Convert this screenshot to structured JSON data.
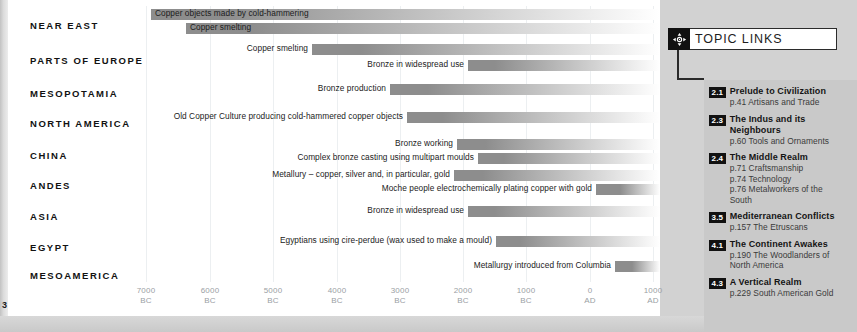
{
  "page": {
    "number": "3"
  },
  "chart_data": {
    "type": "bar",
    "title": "",
    "xlabel": "",
    "ylabel": "",
    "orientation": "horizontal",
    "axis": {
      "grid": true,
      "xlim_labels": [
        "7000 BC",
        "1000 AD"
      ],
      "ticks": [
        {
          "value": "7000",
          "era": "BC",
          "x": 138
        },
        {
          "value": "6000",
          "era": "BC",
          "x": 202
        },
        {
          "value": "5000",
          "era": "BC",
          "x": 265
        },
        {
          "value": "4000",
          "era": "BC",
          "x": 329
        },
        {
          "value": "3000",
          "era": "BC",
          "x": 392
        },
        {
          "value": "2000",
          "era": "BC",
          "x": 455
        },
        {
          "value": "1000",
          "era": "BC",
          "x": 518
        },
        {
          "value": "0",
          "era": "AD",
          "x": 582
        },
        {
          "value": "1000",
          "era": "AD",
          "x": 645
        }
      ]
    },
    "categories": [
      "NEAR EAST",
      "PARTS OF EUROPE",
      "MESOPOTAMIA",
      "NORTH AMERICA",
      "CHINA",
      "ANDES",
      "ASIA",
      "EGYPT",
      "MESOAMERICA"
    ],
    "rows": [
      {
        "label": "NEAR EAST",
        "label_top": 20,
        "bars": [
          {
            "text": "Copper objects made by cold-hammering",
            "start_x": 143,
            "width": 509,
            "top": 9,
            "label_pos": "inside",
            "start_date": "approx. 8000 BC"
          },
          {
            "text": "Copper smelting",
            "start_x": 178,
            "width": 474,
            "top": 23,
            "label_pos": "inside",
            "start_date": "approx. 7450 BC"
          }
        ]
      },
      {
        "label": "PARTS OF EUROPE",
        "label_top": 55,
        "bars": [
          {
            "text": "Copper smelting",
            "start_x": 304,
            "width": 348,
            "top": 44,
            "label_pos": "outside",
            "start_date": "approx. 5000 BC"
          },
          {
            "text": "Bronze in widespread use",
            "start_x": 460,
            "width": 192,
            "top": 60,
            "label_pos": "outside",
            "start_date": "approx. 2550 BC"
          }
        ]
      },
      {
        "label": "MESOPOTAMIA",
        "label_top": 88,
        "bars": [
          {
            "text": "Bronze production",
            "start_x": 382,
            "width": 270,
            "top": 84,
            "label_pos": "outside",
            "start_date": "approx. 3750 BC"
          }
        ]
      },
      {
        "label": "NORTH AMERICA",
        "label_top": 118,
        "bars": [
          {
            "text": "Old Copper Culture producing cold-hammered copper objects",
            "start_x": 399,
            "width": 253,
            "top": 112,
            "label_pos": "outside",
            "start_date": "approx. 3500 BC"
          }
        ]
      },
      {
        "label": "CHINA",
        "label_top": 150,
        "bars": [
          {
            "text": "Bronze working",
            "start_x": 449,
            "width": 203,
            "top": 139,
            "label_pos": "outside",
            "start_date": "approx. 2700 BC"
          },
          {
            "text": "Complex bronze casting using multipart moulds",
            "start_x": 470,
            "width": 182,
            "top": 153,
            "label_pos": "outside",
            "start_date": "approx. 2350 BC"
          }
        ]
      },
      {
        "label": "ANDES",
        "label_top": 180,
        "bars": [
          {
            "text": "Metallury – copper, silver and, in particular, gold",
            "start_x": 446,
            "width": 206,
            "top": 170,
            "label_pos": "outside",
            "start_date": "approx. 2750 BC"
          },
          {
            "text": "Moche people electrochemically plating copper with gold",
            "start_x": 588,
            "width": 64,
            "top": 184,
            "label_pos": "outside",
            "start_date": "approx. AD 100"
          }
        ]
      },
      {
        "label": "ASIA",
        "label_top": 211,
        "bars": [
          {
            "text": "Bronze in widespread use",
            "start_x": 460,
            "width": 192,
            "top": 206,
            "label_pos": "outside",
            "start_date": "approx. 2550 BC"
          }
        ]
      },
      {
        "label": "EGYPT",
        "label_top": 242,
        "bars": [
          {
            "text": "Egyptians using cire-perdue (wax used to make a mould)",
            "start_x": 488,
            "width": 164,
            "top": 236,
            "label_pos": "outside",
            "start_date": "approx. 2100 BC"
          }
        ]
      },
      {
        "label": "MESOAMERICA",
        "label_top": 270,
        "bars": [
          {
            "text": "Metallurgy introduced from Columbia",
            "start_x": 607,
            "width": 45,
            "top": 261,
            "label_pos": "outside",
            "start_date": "approx. AD 400"
          }
        ]
      }
    ],
    "colors": {
      "bar_dark": "#8d8d8d",
      "bar_fade": "#ffffff",
      "grid": "#eceff1",
      "tick_text": "#9aa0a4"
    }
  },
  "topic_links": {
    "title": "TOPIC LINKS",
    "icon": "compass-four-way-icon",
    "items": [
      {
        "num": "2.1",
        "heading": "Prelude to Civilization",
        "lines": [
          "p.41 Artisans and Trade"
        ]
      },
      {
        "num": "2.3",
        "heading": "The Indus and its Neighbours",
        "lines": [
          "p.60 Tools and Ornaments"
        ]
      },
      {
        "num": "2.4",
        "heading": "The Middle Realm",
        "lines": [
          "p.71 Craftsmanship",
          "p.74 Technology",
          "p.76 Metalworkers of the",
          "South"
        ]
      },
      {
        "num": "3.5",
        "heading": "Mediterranean Conflicts",
        "lines": [
          "p.157 The Etruscans"
        ]
      },
      {
        "num": "4.1",
        "heading": "The Continent Awakes",
        "lines": [
          "p.190 The Woodlanders of",
          "North America"
        ]
      },
      {
        "num": "4.3",
        "heading": "A Vertical Realm",
        "lines": [
          "p.229 South American Gold"
        ]
      }
    ]
  }
}
